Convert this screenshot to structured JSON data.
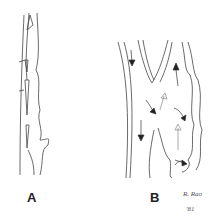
{
  "figure": {
    "panel_a": {
      "label": "A"
    },
    "panel_b": {
      "label": "B"
    },
    "signature": {
      "name": "R. Rao",
      "year": "'81"
    }
  }
}
